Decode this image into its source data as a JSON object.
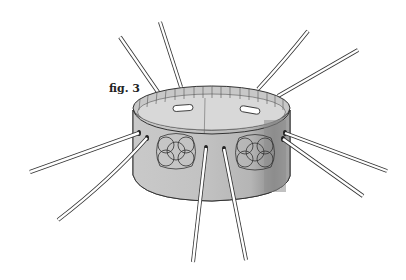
{
  "illustration": {
    "caption": "fig. 3",
    "subject": "woven band ring with radiating straps",
    "colors": {
      "band_fill": "#bdbdbd",
      "band_inner": "#d6d6d6",
      "band_dark": "#8f8f8f",
      "outline": "#333333",
      "strap_fill": "#ffffff"
    },
    "strap_count": 10,
    "slot_count": 2,
    "knot_motif_count": 2
  }
}
